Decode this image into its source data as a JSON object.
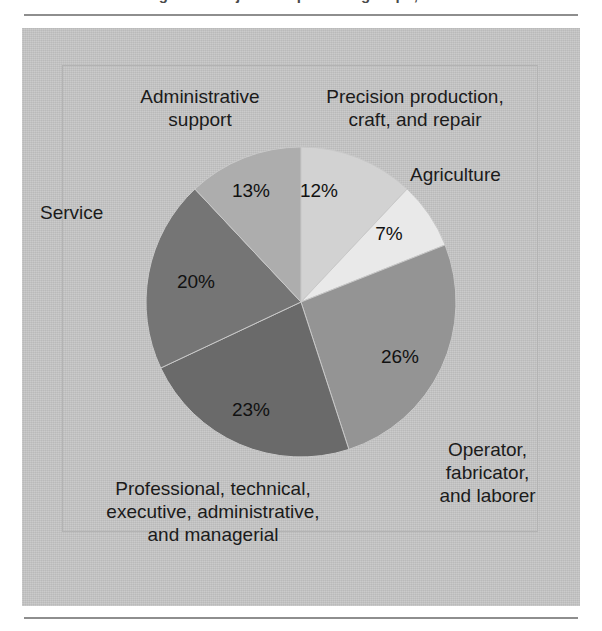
{
  "figure": {
    "caption_fragment": "Figure 1.  Major occupational groups, 1993",
    "frame_color": "#8e8e8e",
    "panel_color": "#c6c6c6"
  },
  "chart_data": {
    "type": "pie",
    "title": "",
    "subtitle": "",
    "xlabel": "",
    "ylabel": "",
    "legend_position": "none",
    "grid": false,
    "total": 101,
    "units": "percent",
    "start_angle_deg": 0,
    "direction": "clockwise",
    "categories": [
      "Precision production, craft, and repair",
      "Agriculture",
      "Operator, fabricator, and laborer",
      "Professional, technical, executive, administrative, and managerial",
      "Service",
      "Administrative support"
    ],
    "values": [
      12,
      7,
      26,
      23,
      20,
      13
    ],
    "labels": [
      "12%",
      "7%",
      "26%",
      "23%",
      "20%",
      "13%"
    ],
    "colors": [
      "#d2d2d2",
      "#e9e9e9",
      "#949494",
      "#6a6a6a",
      "#757575",
      "#adadad"
    ],
    "slices": [
      {
        "name": "precision-production",
        "label": "Precision production,\ncraft, and repair",
        "value": 12,
        "pct_label": "12%",
        "color": "#d2d2d2",
        "start_deg": 0,
        "end_deg": 43.2
      },
      {
        "name": "agriculture",
        "label": "Agriculture",
        "value": 7,
        "pct_label": "7%",
        "color": "#e9e9e9",
        "start_deg": 43.2,
        "end_deg": 68.4
      },
      {
        "name": "operator-fabricator-laborer",
        "label": "Operator,\nfabricator,\nand laborer",
        "value": 26,
        "pct_label": "26%",
        "color": "#949494",
        "start_deg": 68.4,
        "end_deg": 162.0
      },
      {
        "name": "professional-technical",
        "label": "Professional, technical,\nexecutive, administrative,\nand managerial",
        "value": 23,
        "pct_label": "23%",
        "color": "#6a6a6a",
        "start_deg": 162.0,
        "end_deg": 244.8
      },
      {
        "name": "service",
        "label": "Service",
        "value": 20,
        "pct_label": "20%",
        "color": "#757575",
        "start_deg": 244.8,
        "end_deg": 316.8
      },
      {
        "name": "administrative-support",
        "label": "Administrative\nsupport",
        "value": 13,
        "pct_label": "13%",
        "color": "#adadad",
        "start_deg": 316.8,
        "end_deg": 360.0
      }
    ]
  }
}
